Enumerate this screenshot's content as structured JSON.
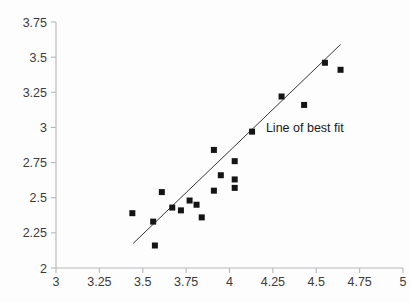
{
  "chart_data": {
    "type": "scatter",
    "title": "",
    "xlabel": "",
    "ylabel": "",
    "xlim": [
      3,
      5
    ],
    "ylim": [
      2,
      3.75
    ],
    "xticks": [
      "3",
      "3.25",
      "3.5",
      "3.75",
      "4",
      "4.25",
      "4.5",
      "4.75",
      "5"
    ],
    "xtick_values": [
      3,
      3.25,
      3.5,
      3.75,
      4,
      4.25,
      4.5,
      4.75,
      5
    ],
    "yticks": [
      "2",
      "2.25",
      "2.5",
      "2.75",
      "3",
      "3.25",
      "3.5",
      "3.75"
    ],
    "ytick_values": [
      2,
      2.25,
      2.5,
      2.75,
      3,
      3.25,
      3.5,
      3.75
    ],
    "grid": false,
    "legend": false,
    "marker": "square",
    "marker_color": "#141414",
    "marker_size_px": 6,
    "points": [
      {
        "x": 3.44,
        "y": 2.39
      },
      {
        "x": 3.56,
        "y": 2.33
      },
      {
        "x": 3.57,
        "y": 2.16
      },
      {
        "x": 3.61,
        "y": 2.54
      },
      {
        "x": 3.67,
        "y": 2.43
      },
      {
        "x": 3.72,
        "y": 2.41
      },
      {
        "x": 3.77,
        "y": 2.48
      },
      {
        "x": 3.81,
        "y": 2.45
      },
      {
        "x": 3.84,
        "y": 2.36
      },
      {
        "x": 3.91,
        "y": 2.84
      },
      {
        "x": 3.91,
        "y": 2.55
      },
      {
        "x": 3.95,
        "y": 2.66
      },
      {
        "x": 4.03,
        "y": 2.76
      },
      {
        "x": 4.03,
        "y": 2.63
      },
      {
        "x": 4.03,
        "y": 2.57
      },
      {
        "x": 4.13,
        "y": 2.97
      },
      {
        "x": 4.3,
        "y": 3.22
      },
      {
        "x": 4.43,
        "y": 3.16
      },
      {
        "x": 4.55,
        "y": 3.46
      },
      {
        "x": 4.64,
        "y": 3.41
      }
    ],
    "fit_line": {
      "label": "Line of best fit",
      "x_start": 3.445,
      "y_start": 2.175,
      "x_end": 4.64,
      "y_end": 3.59,
      "color": "#2a2a2a"
    },
    "annotations": [
      {
        "text": "Line of best fit",
        "x": 4.21,
        "y": 2.965
      }
    ]
  },
  "axes": {
    "y_axis_name": "y-axis",
    "x_axis_name": "x-axis",
    "axis_color": "#b9b9bd"
  }
}
